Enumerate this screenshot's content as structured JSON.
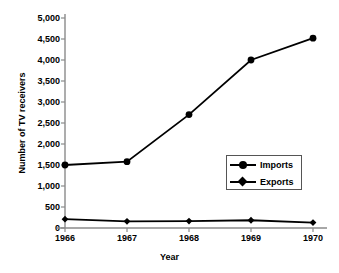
{
  "chart_data": {
    "type": "line",
    "title": "",
    "xlabel": "Year",
    "ylabel": "Number of TV receivers",
    "categories": [
      "1966",
      "1967",
      "1968",
      "1969",
      "1970"
    ],
    "x": [
      1966,
      1967,
      1968,
      1969,
      1970
    ],
    "series": [
      {
        "name": "Imports",
        "marker": "circle",
        "color": "#000000",
        "values": [
          1500,
          1580,
          2700,
          4000,
          4520
        ]
      },
      {
        "name": "Exports",
        "marker": "diamond",
        "color": "#000000",
        "values": [
          210,
          160,
          165,
          185,
          130
        ]
      }
    ],
    "ylim": [
      0,
      5000
    ],
    "ytick_labels": [
      "5,000",
      "4,500",
      "4,000",
      "3,500",
      "3,000",
      "2,500",
      "2,000",
      "1,500",
      "1,000",
      "500",
      "0"
    ],
    "ytick_values": [
      5000,
      4500,
      4000,
      3500,
      3000,
      2500,
      2000,
      1500,
      1000,
      500,
      0
    ],
    "grid": false,
    "legend_position": "center-right",
    "legend_entries": [
      "Imports",
      "Exports"
    ]
  },
  "axes": {
    "y_title": "Number of TV receivers",
    "x_title": "Year"
  },
  "legend": {
    "imports_label": "Imports",
    "exports_label": "Exports"
  }
}
